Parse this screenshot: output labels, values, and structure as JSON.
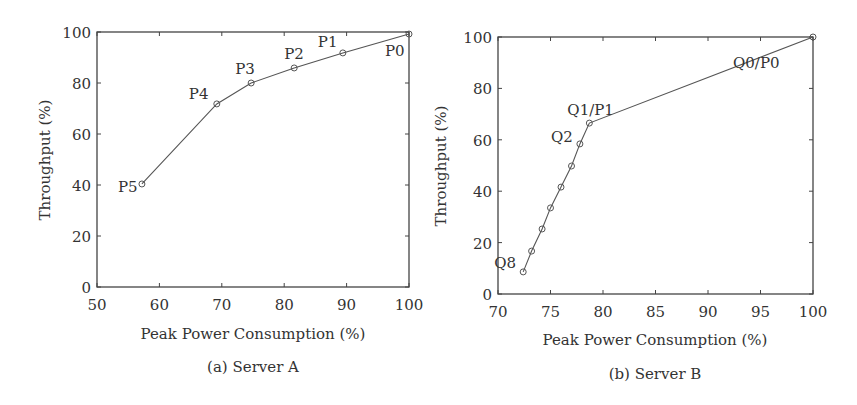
{
  "chart_data": [
    {
      "type": "line",
      "title": "",
      "caption": "(a) Server A",
      "xlabel": "Peak Power Consumption (%)",
      "ylabel": "Throughput (%)",
      "xlim": [
        50,
        100
      ],
      "ylim": [
        0,
        100
      ],
      "xticks": [
        50,
        60,
        70,
        80,
        90,
        100
      ],
      "yticks": [
        0,
        20,
        40,
        60,
        80,
        100
      ],
      "grid": false,
      "series": [
        {
          "name": "Server A",
          "color": "#555555",
          "marker": "circle",
          "points": [
            {
              "label": "P5",
              "x": 57.2,
              "y": 40.4
            },
            {
              "label": "P4",
              "x": 69.2,
              "y": 71.8
            },
            {
              "label": "P3",
              "x": 74.7,
              "y": 80.0
            },
            {
              "label": "P2",
              "x": 81.6,
              "y": 85.9
            },
            {
              "label": "P1",
              "x": 89.4,
              "y": 91.8
            },
            {
              "label": "P0",
              "x": 100,
              "y": 99.2
            }
          ]
        }
      ]
    },
    {
      "type": "line",
      "title": "",
      "caption": "(b) Server B",
      "xlabel": "Peak Power Consumption (%)",
      "ylabel": "Throughput (%)",
      "xlim": [
        70,
        100
      ],
      "ylim": [
        0,
        100
      ],
      "xticks": [
        70,
        75,
        80,
        85,
        90,
        95,
        100
      ],
      "yticks": [
        0,
        20,
        40,
        60,
        80,
        100
      ],
      "grid": false,
      "series": [
        {
          "name": "Server B",
          "color": "#555555",
          "marker": "circle",
          "points": [
            {
              "label": "Q8",
              "x": 72.4,
              "y": 8.6
            },
            {
              "label": "",
              "x": 73.2,
              "y": 16.7
            },
            {
              "label": "",
              "x": 74.2,
              "y": 25.3
            },
            {
              "label": "",
              "x": 75.0,
              "y": 33.5
            },
            {
              "label": "",
              "x": 76.0,
              "y": 41.6
            },
            {
              "label": "",
              "x": 77.0,
              "y": 49.8
            },
            {
              "label": "Q2",
              "x": 77.8,
              "y": 58.4
            },
            {
              "label": "Q1/P1",
              "x": 78.7,
              "y": 66.5
            },
            {
              "label": "Q0/P0",
              "x": 100,
              "y": 100
            }
          ]
        }
      ]
    }
  ]
}
